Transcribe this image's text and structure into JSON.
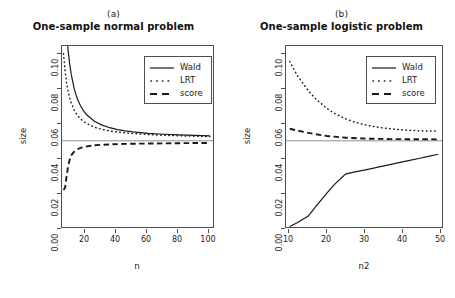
{
  "figure": {
    "background": "#ffffff",
    "line_color": "#1a1a1a",
    "reference_line_color": "#909090",
    "axis_color": "#4d4d4d"
  },
  "panels": [
    {
      "tag": "(a)",
      "title": "One-sample normal problem",
      "xlabel": "n",
      "ylabel": "size",
      "xticks": [
        "20",
        "40",
        "60",
        "80",
        "100"
      ],
      "yticks": [
        "0.00",
        "0.02",
        "0.04",
        "0.06",
        "0.08",
        "0.10"
      ],
      "legend": [
        {
          "label": "Wald",
          "style": "solid"
        },
        {
          "label": "LRT",
          "style": "dotted"
        },
        {
          "label": "score",
          "style": "dashed"
        }
      ]
    },
    {
      "tag": "(b)",
      "title": "One-sample logistic problem",
      "xlabel": "n2",
      "ylabel": "size",
      "xticks": [
        "10",
        "20",
        "30",
        "40",
        "50"
      ],
      "yticks": [
        "0.00",
        "0.02",
        "0.04",
        "0.06",
        "0.08",
        "0.10"
      ],
      "legend": [
        {
          "label": "Wald",
          "style": "solid"
        },
        {
          "label": "LRT",
          "style": "dotted"
        },
        {
          "label": "score",
          "style": "dashed"
        }
      ]
    }
  ],
  "chart_data": [
    {
      "type": "line",
      "panel": "(a)",
      "title": "One-sample normal problem",
      "xlabel": "n",
      "ylabel": "size",
      "xlim": [
        4,
        102
      ],
      "ylim": [
        0.0,
        0.105
      ],
      "xticks": [
        20,
        40,
        60,
        80,
        100
      ],
      "yticks": [
        0.0,
        0.02,
        0.04,
        0.06,
        0.08,
        0.1
      ],
      "grid": false,
      "legend_position": "top-right",
      "reference_line": {
        "y": 0.05,
        "orientation": "horizontal",
        "color": "#909090"
      },
      "x": [
        5,
        6,
        7,
        8,
        9,
        10,
        12,
        14,
        16,
        18,
        20,
        25,
        30,
        35,
        40,
        45,
        50,
        60,
        70,
        80,
        90,
        100
      ],
      "series": [
        {
          "name": "Wald",
          "style": "solid",
          "values": [
            0.148,
            0.128,
            0.113,
            0.102,
            0.0945,
            0.0885,
            0.0798,
            0.0742,
            0.0703,
            0.0674,
            0.0651,
            0.0613,
            0.0591,
            0.0576,
            0.0565,
            0.0558,
            0.0552,
            0.0543,
            0.0538,
            0.0534,
            0.0531,
            0.0529
          ]
        },
        {
          "name": "LRT",
          "style": "dotted",
          "values": [
            0.1005,
            0.0905,
            0.0835,
            0.0785,
            0.0748,
            0.0718,
            0.0676,
            0.0648,
            0.0628,
            0.0612,
            0.06,
            0.0579,
            0.0566,
            0.0557,
            0.0551,
            0.0546,
            0.0542,
            0.0536,
            0.0532,
            0.0529,
            0.0527,
            0.0525
          ]
        },
        {
          "name": "score",
          "style": "dashed",
          "values": [
            0.0215,
            0.0228,
            0.0295,
            0.0355,
            0.0392,
            0.0416,
            0.0438,
            0.0451,
            0.0459,
            0.0464,
            0.0468,
            0.0474,
            0.0477,
            0.0479,
            0.0481,
            0.0482,
            0.0483,
            0.0484,
            0.0485,
            0.0486,
            0.0487,
            0.0487
          ]
        }
      ]
    },
    {
      "type": "line",
      "panel": "(b)",
      "title": "One-sample logistic problem",
      "xlabel": "n2",
      "ylabel": "size",
      "xlim": [
        9,
        51
      ],
      "ylim": [
        0.0,
        0.105
      ],
      "xticks": [
        10,
        20,
        30,
        40,
        50
      ],
      "yticks": [
        0.0,
        0.02,
        0.04,
        0.06,
        0.08,
        0.1
      ],
      "grid": false,
      "legend_position": "top-right",
      "reference_line": {
        "y": 0.05,
        "orientation": "horizontal",
        "color": "#909090"
      },
      "x": [
        10,
        12,
        15,
        17,
        20,
        22,
        25,
        27,
        30,
        32,
        35,
        37,
        40,
        42,
        45,
        47,
        50
      ],
      "series": [
        {
          "name": "Wald",
          "style": "solid",
          "values": [
            0.0003,
            0.0025,
            0.0063,
            0.0118,
            0.0196,
            0.0246,
            0.0307,
            0.0317,
            0.033,
            0.0339,
            0.0353,
            0.0362,
            0.0376,
            0.0385,
            0.0399,
            0.0408,
            0.0422
          ]
        },
        {
          "name": "LRT",
          "style": "dotted",
          "values": [
            0.096,
            0.088,
            0.079,
            0.0743,
            0.0688,
            0.066,
            0.0628,
            0.0612,
            0.0594,
            0.0585,
            0.0575,
            0.057,
            0.0564,
            0.0561,
            0.0558,
            0.0557,
            0.0556
          ]
        },
        {
          "name": "score",
          "style": "dashed",
          "values": [
            0.057,
            0.056,
            0.0546,
            0.0538,
            0.0528,
            0.0524,
            0.0518,
            0.0516,
            0.0513,
            0.0512,
            0.0511,
            0.051,
            0.051,
            0.0509,
            0.0509,
            0.0509,
            0.0508
          ]
        }
      ]
    }
  ]
}
